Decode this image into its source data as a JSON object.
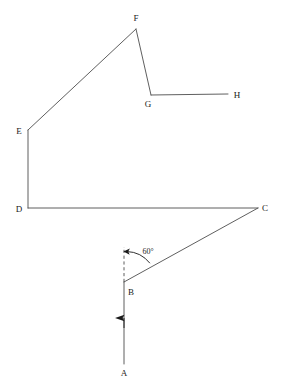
{
  "figure": {
    "kind": "geometric-line-diagram",
    "width": 282,
    "height": 389,
    "background_color": "#ffffff",
    "stroke_color": "#4d4d4d",
    "label_color": "#1a1a1a",
    "stroke_width": 0.9
  },
  "labels": {
    "a": "A",
    "b": "B",
    "c": "C",
    "d": "D",
    "e": "E",
    "f": "F",
    "g": "G",
    "h": "H",
    "angle": "60°"
  },
  "points": {
    "A": {
      "x": 124,
      "y": 364,
      "label_x": 124,
      "label_y": 373
    },
    "B": {
      "x": 124,
      "y": 282,
      "label_x": 131,
      "label_y": 292
    },
    "C": {
      "x": 258,
      "y": 208,
      "label_x": 265,
      "label_y": 208
    },
    "D": {
      "x": 28,
      "y": 208,
      "label_x": 19,
      "label_y": 209
    },
    "E": {
      "x": 28,
      "y": 130,
      "label_x": 19,
      "label_y": 131
    },
    "F": {
      "x": 136,
      "y": 29,
      "label_x": 136,
      "label_y": 18
    },
    "G": {
      "x": 151,
      "y": 95,
      "label_x": 148,
      "label_y": 104
    },
    "H": {
      "x": 228,
      "y": 94,
      "label_x": 237,
      "label_y": 95
    },
    "dash_top": {
      "x": 124,
      "y": 247
    },
    "angle_label": {
      "x": 148,
      "y": 252
    }
  },
  "segments": [
    {
      "name": "A-to-B",
      "from": "A",
      "to": "B",
      "style": "solid",
      "arrow": "midpoint-up"
    },
    {
      "name": "B-to-C",
      "from": "B",
      "to": "C",
      "style": "solid",
      "arrow": "none"
    },
    {
      "name": "D-to-C",
      "from": "D",
      "to": "C",
      "style": "solid",
      "arrow": "none"
    },
    {
      "name": "D-to-E",
      "from": "D",
      "to": "E",
      "style": "solid",
      "arrow": "none"
    },
    {
      "name": "E-to-F",
      "from": "E",
      "to": "F",
      "style": "solid",
      "arrow": "none"
    },
    {
      "name": "F-to-G",
      "from": "F",
      "to": "G",
      "style": "solid",
      "arrow": "none"
    },
    {
      "name": "G-to-H",
      "from": "G",
      "to": "H",
      "style": "solid",
      "arrow": "none"
    },
    {
      "name": "B-vertical-reference",
      "from": "B",
      "to": "dash_top",
      "style": "dashed",
      "arrow": "none"
    }
  ],
  "annotations": {
    "angle_arc": {
      "name": "angle-arc-60",
      "vertex": "B",
      "value": "60°",
      "radius": 31,
      "from_ray": "B-to-C",
      "to_ray": "B-vertical-reference",
      "arrowhead_at": "vertical-reference-end"
    }
  }
}
